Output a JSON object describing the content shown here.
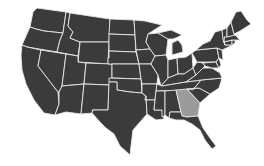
{
  "map": {
    "title": "United States",
    "colors": {
      "background": "#ffffff",
      "default_fill": "#3b3b3b",
      "highlight_fill": "#9b9b9b",
      "border": "#e8e8e8"
    },
    "highlighted_states": [
      "Georgia"
    ],
    "states": [
      {
        "name": "Washington",
        "id": "WA",
        "highlighted": false,
        "points": "37,8 66,12 63,33 44,31 36,29 30,27 33,12"
      },
      {
        "name": "Oregon",
        "id": "OR",
        "highlighted": false,
        "points": "30,27 36,29 44,31 63,33 60,40 57,52 27,47 22,45"
      },
      {
        "name": "California",
        "id": "CA",
        "highlighted": false,
        "points": "22,45 27,47 41,50 38,66 58,92 59,104 55,115 44,113 34,100 26,84 22,70 21,55"
      },
      {
        "name": "Idaho",
        "id": "ID",
        "highlighted": false,
        "points": "66,12 70,13 68,26 73,32 70,38 80,42 78,56 57,52 60,40 63,33"
      },
      {
        "name": "Nevada",
        "id": "NV",
        "highlighted": false,
        "points": "41,50 66,54 62,86 59,92 58,92 38,66"
      },
      {
        "name": "Montana",
        "id": "MT",
        "highlighted": false,
        "points": "70,13 110,19 109,42 80,42 70,38 73,32 68,26"
      },
      {
        "name": "Wyoming",
        "id": "WY",
        "highlighted": false,
        "points": "80,42 109,42 108,64 78,62"
      },
      {
        "name": "Utah",
        "id": "UT",
        "highlighted": false,
        "points": "66,54 78,56 78,62 86,63 84,84 62,86"
      },
      {
        "name": "Arizona",
        "id": "AZ",
        "highlighted": false,
        "points": "62,86 84,84 81,114 66,112 55,115 59,104 59,92"
      },
      {
        "name": "Colorado",
        "id": "CO",
        "highlighted": false,
        "points": "86,63 112,64 112,85 84,84"
      },
      {
        "name": "New Mexico",
        "id": "NM",
        "highlighted": false,
        "points": "84,84 109,85 108,110 92,110 93,113 81,114"
      },
      {
        "name": "North Dakota",
        "id": "ND",
        "highlighted": false,
        "points": "110,19 134,20 135,35 109,34"
      },
      {
        "name": "South Dakota",
        "id": "SD",
        "highlighted": false,
        "points": "109,34 135,35 136,52 109,51"
      },
      {
        "name": "Nebraska",
        "id": "NE",
        "highlighted": false,
        "points": "109,51 136,52 139,64 112,64 108,64 108,58 109,58"
      },
      {
        "name": "Kansas",
        "id": "KS",
        "highlighted": false,
        "points": "112,64 139,64 141,79 112,78"
      },
      {
        "name": "Oklahoma",
        "id": "OK",
        "highlighted": false,
        "points": "109,78 141,79 142,93 130,92 117,90 117,82 109,82"
      },
      {
        "name": "Texas",
        "id": "TX",
        "highlighted": false,
        "points": "109,82 117,82 117,90 130,92 142,93 146,96 147,114 140,122 133,130 131,146 130,155 120,146 114,134 106,128 100,122 92,113 93,110 108,110"
      },
      {
        "name": "Minnesota",
        "id": "MN",
        "highlighted": false,
        "points": "134,20 145,21 162,25 148,34 146,42 150,49 136,50 135,35"
      },
      {
        "name": "Iowa",
        "id": "IA",
        "highlighted": false,
        "points": "136,50 150,49 155,56 151,64 139,64"
      },
      {
        "name": "Missouri",
        "id": "MO",
        "highlighted": false,
        "points": "139,64 151,64 158,75 157,84 148,84 142,84 141,79"
      },
      {
        "name": "Arkansas",
        "id": "AR",
        "highlighted": false,
        "points": "142,84 157,84 155,100 145,100 146,96 142,93"
      },
      {
        "name": "Louisiana",
        "id": "LA",
        "highlighted": false,
        "points": "145,100 155,100 154,110 162,110 164,119 156,120 147,114 146,96"
      },
      {
        "name": "Wisconsin",
        "id": "WI",
        "highlighted": false,
        "points": "148,34 158,33 168,39 166,55 155,56 150,49 146,42"
      },
      {
        "name": "Illinois",
        "id": "IL",
        "highlighted": false,
        "points": "155,56 166,55 168,60 168,78 161,86 158,75 151,64"
      },
      {
        "name": "Michigan",
        "id": "MI",
        "highlighted": false,
        "points": "158,33 171,30 182,35 178,37 173,39 168,39 M172,43 178,40 182,45 183,52 172,55"
      },
      {
        "name": "Indiana",
        "id": "IN",
        "highlighted": false,
        "points": "168,60 177,58 178,74 168,78"
      },
      {
        "name": "Ohio",
        "id": "OH",
        "highlighted": false,
        "points": "177,58 186,57 192,53 193,68 184,74 178,74"
      },
      {
        "name": "Kentucky",
        "id": "KY",
        "highlighted": false,
        "points": "161,86 168,78 178,74 184,74 193,68 196,75 186,82 162,86"
      },
      {
        "name": "Tennessee",
        "id": "TN",
        "highlighted": false,
        "points": "157,84 162,86 186,82 201,80 193,90 156,91"
      },
      {
        "name": "Mississippi",
        "id": "MS",
        "highlighted": false,
        "points": "156,91 165,91 165,115 162,117 162,110 154,110 155,100"
      },
      {
        "name": "Alabama",
        "id": "AL",
        "highlighted": false,
        "points": "165,91 176,90 181,112 170,112 169,118 165,115"
      },
      {
        "name": "Georgia",
        "id": "GA",
        "highlighted": true,
        "points": "176,90 187,89 200,103 198,116 187,117 182,116 181,112"
      },
      {
        "name": "Florida",
        "id": "FL",
        "highlighted": false,
        "points": "169,118 170,112 181,112 182,116 187,117 198,116 203,128 210,138 216,146 212,149 205,140 200,130 192,124 184,120 176,120"
      },
      {
        "name": "South Carolina",
        "id": "SC",
        "highlighted": false,
        "points": "187,89 199,88 210,94 200,103"
      },
      {
        "name": "North Carolina",
        "id": "NC",
        "highlighted": false,
        "points": "193,90 201,80 222,78 219,88 210,94 199,88 187,89"
      },
      {
        "name": "Virginia",
        "id": "VA",
        "highlighted": false,
        "points": "186,82 196,75 203,68 212,68 220,73 222,78 201,80"
      },
      {
        "name": "West Virginia",
        "id": "WV",
        "highlighted": false,
        "points": "193,68 197,62 203,63 205,66 203,68 196,75"
      },
      {
        "name": "Pennsylvania",
        "id": "PA",
        "highlighted": false,
        "points": "192,53 196,50 217,48 219,58 216,62 197,62"
      },
      {
        "name": "Maryland",
        "id": "MD",
        "highlighted": false,
        "points": "203,63 216,62 219,68 212,68 205,66"
      },
      {
        "name": "Delaware",
        "id": "DE",
        "highlighted": false,
        "points": "216,62 219,58 221,65 219,68"
      },
      {
        "name": "New Jersey",
        "id": "NJ",
        "highlighted": false,
        "points": "217,48 222,50 223,60 219,58"
      },
      {
        "name": "New York",
        "id": "NY",
        "highlighted": false,
        "points": "196,50 203,44 210,41 215,32 222,30 225,45 233,45 222,50 217,48"
      },
      {
        "name": "Connecticut",
        "id": "CT",
        "highlighted": false,
        "points": "224,42 232,40 232,45 225,45"
      },
      {
        "name": "Rhode Island",
        "id": "RI",
        "highlighted": false,
        "points": "232,40 235,40 235,43 232,45"
      },
      {
        "name": "Massachusetts",
        "id": "MA",
        "highlighted": false,
        "points": "224,37 235,35 240,40 235,40 232,40 224,42"
      },
      {
        "name": "Vermont",
        "id": "VT",
        "highlighted": false,
        "points": "222,30 227,28 227,37 224,37 224,42 225,45 223,40"
      },
      {
        "name": "New Hampshire",
        "id": "NH",
        "highlighted": false,
        "points": "227,28 231,22 234,34 235,35 227,37"
      },
      {
        "name": "Maine",
        "id": "MA-ME",
        "highlighted": false,
        "points": "231,22 236,12 241,11 247,20 251,24 240,31 234,34"
      }
    ]
  }
}
